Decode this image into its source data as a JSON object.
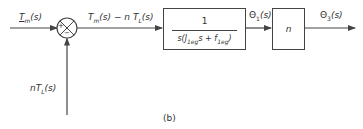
{
  "diagram": {
    "type": "block-diagram",
    "caption": "(b)",
    "signals": {
      "input": "T_m(s)",
      "input_display": "Tm(s)",
      "error": "T_m(s) − n T_L(s)",
      "error_display": "Tm(s) − n TL(s)",
      "disturbance": "n T_L(s)",
      "disturbance_display": "nTL(s)",
      "intermediate": "Θ1(s)",
      "output": "Θ3(s)"
    },
    "summing_junction": {
      "plus_sign": "+",
      "minus_sign": "−"
    },
    "blocks": [
      {
        "id": "plant",
        "numerator": "1",
        "denominator": "s(J1eq s + f1eq)"
      },
      {
        "id": "gear",
        "content": "n"
      }
    ],
    "labels": {
      "input_T": "T",
      "input_sub": "m",
      "input_rest": "(s)",
      "error_T": "T",
      "error_sub": "m",
      "error_rest": "(s) − n T",
      "error_sub2": "L",
      "error_rest2": "(s)",
      "dist_n": "nT",
      "dist_sub": "L",
      "dist_rest": "(s)",
      "plant_num": "1",
      "plant_den_s": "s(J",
      "plant_den_sub1": "1eg",
      "plant_den_mid": "s + f",
      "plant_den_sub2": "1eg",
      "plant_den_end": ")",
      "theta1": "Θ",
      "theta1_sub": "1",
      "theta1_rest": "(s)",
      "gear": "n",
      "theta3": "Θ",
      "theta3_sub": "3",
      "theta3_rest": "(s)"
    },
    "colors": {
      "line": "#444444",
      "text": "#333333",
      "background": "#ffffff"
    }
  }
}
